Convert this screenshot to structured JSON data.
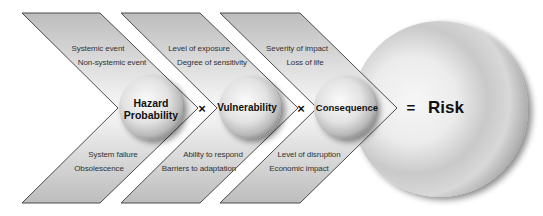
{
  "diagram": {
    "stages": [
      {
        "name": "Hazard Probability",
        "label_lines": [
          "Hazard",
          "Probability"
        ],
        "top_factors": [
          "Systemic event",
          "Non-systemic event"
        ],
        "bottom_factors": [
          "System failure",
          "Obsolescence"
        ]
      },
      {
        "name": "Vulnerability",
        "label_lines": [
          "Vulnerability"
        ],
        "top_factors": [
          "Level of exposure",
          "Degree of sensitivity"
        ],
        "bottom_factors": [
          "Ability to respond",
          "Barriers to adaptation"
        ]
      },
      {
        "name": "Consequence",
        "label_lines": [
          "Consequence"
        ],
        "top_factors": [
          "Severity of impact",
          "Loss of life"
        ],
        "bottom_factors": [
          "Level of disruption",
          "Economic impact"
        ]
      }
    ],
    "operators": [
      "×",
      "×",
      "="
    ],
    "result": "Risk",
    "colors": {
      "chevron_fill": "#c8c8c8",
      "chevron_stroke": "#4a4a4a",
      "sphere_light": "#f4f4f4",
      "sphere_dark": "#8a8a8a",
      "text": "#333333"
    }
  }
}
